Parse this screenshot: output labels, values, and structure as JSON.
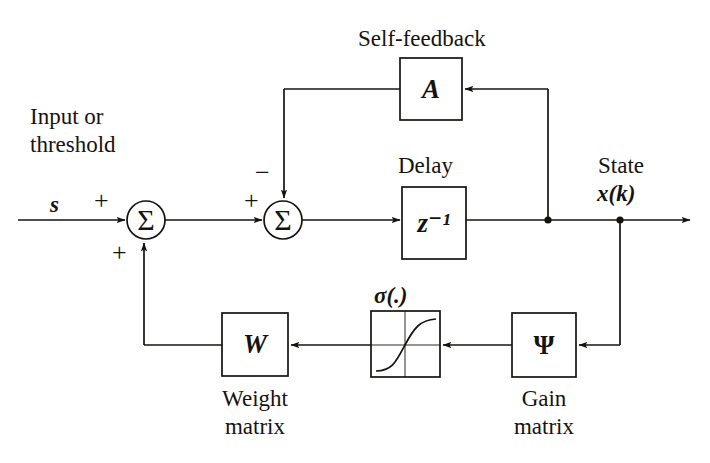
{
  "figure": {
    "background_color": "#ffffff",
    "ink_color": "#16130f"
  },
  "labels": {
    "input_line1": "Input or",
    "input_line2": "threshold",
    "input_signal": "s",
    "self_feedback": "Self-feedback",
    "delay": "Delay",
    "state_line1": "State",
    "state_line2": "x(k)",
    "sigma_label": "σ(.)",
    "weight_line1": "Weight",
    "weight_line2": "matrix",
    "gain_line1": "Gain",
    "gain_line2": "matrix"
  },
  "signs": {
    "sum1_top_plus": "+",
    "sum1_bottom_plus": "+",
    "sum2_left_plus": "+",
    "sum2_top_minus": "−"
  },
  "blocks": [
    {
      "id": "block-a",
      "name": "self-feedback-matrix-block",
      "symbol": "A",
      "caption_above": "Self-feedback",
      "x": 400,
      "y": 58,
      "w": 62,
      "h": 62,
      "italic": true
    },
    {
      "id": "block-delay",
      "name": "unit-delay-block",
      "symbol": "z⁻¹",
      "caption_above": "Delay",
      "x": 402,
      "y": 187,
      "w": 64,
      "h": 72,
      "italic": true
    },
    {
      "id": "block-weight",
      "name": "weight-matrix-block",
      "symbol": "W",
      "caption_below": "Weight matrix",
      "x": 222,
      "y": 313,
      "w": 66,
      "h": 63,
      "italic": true
    },
    {
      "id": "block-sigmoid",
      "name": "sigmoid-activation-block",
      "symbol": "",
      "caption_above": "σ(.)",
      "x": 371,
      "y": 311,
      "w": 69,
      "h": 66,
      "italic": false
    },
    {
      "id": "block-gain",
      "name": "gain-matrix-block",
      "symbol": "Ψ",
      "caption_below": "Gain matrix",
      "x": 512,
      "y": 313,
      "w": 64,
      "h": 64,
      "italic": false
    }
  ],
  "summing_junctions": [
    {
      "id": "sum-1",
      "name": "input-summing-junction",
      "cx": 146,
      "cy": 220,
      "r": 19,
      "glyph": "Σ"
    },
    {
      "id": "sum-2",
      "name": "feedback-summing-junction",
      "cx": 283,
      "cy": 220,
      "r": 19,
      "glyph": "Σ"
    }
  ],
  "junction_dots": [
    {
      "id": "dot-a",
      "name": "state-tap-self-feedback",
      "cx": 548,
      "cy": 220,
      "r": 3.6
    },
    {
      "id": "dot-b",
      "name": "state-tap-gain-path",
      "cx": 620,
      "cy": 220,
      "r": 3.6
    }
  ],
  "signal_path_description": {
    "forward": "s enters summing junction 1, result to summing junction 2, through z^-1 delay block, to state x(k) output",
    "self_feedback": "state tap at x=548 rises to A block input, A output travels left and down into summing junction 2 with minus sign",
    "output_feedback": "state tap at x=620 drops to gain matrix Psi, through sigmoid sigma(.), through weight matrix W, then left and up into summing junction 1 with plus sign"
  }
}
